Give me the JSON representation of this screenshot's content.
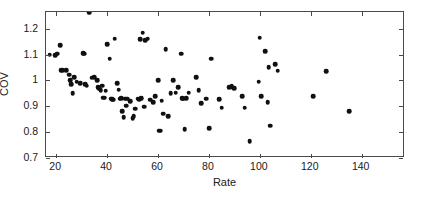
{
  "chart_data": {
    "type": "scatter",
    "title": "",
    "xlabel": "Rate",
    "ylabel": "COV",
    "xlim": [
      16,
      157
    ],
    "ylim": [
      0.7,
      1.265
    ],
    "xticks": [
      20,
      40,
      60,
      80,
      100,
      120,
      140
    ],
    "yticks": [
      0.7,
      0.8,
      0.9,
      1,
      1.1,
      1.2
    ],
    "xticklabels": [
      "20",
      "40",
      "60",
      "80",
      "100",
      "120",
      "140"
    ],
    "yticklabels": [
      "0.7",
      "0.8",
      "0.9",
      "1",
      "1.1",
      "1.2"
    ],
    "grid": false,
    "legend": null,
    "marker": "filled-circle",
    "marker_color": "#101010",
    "series": [
      {
        "name": "observations",
        "x": [
          17.5,
          19.5,
          20.5,
          21.5,
          22.0,
          22.5,
          24.0,
          25.0,
          25.5,
          26.0,
          26.5,
          27.0,
          28.0,
          29.5,
          30.5,
          31.0,
          31.5,
          32.0,
          33.0,
          34.0,
          35.0,
          36.0,
          36.5,
          37.0,
          37.5,
          38.0,
          38.5,
          39.0,
          39.5,
          40.0,
          41.0,
          41.5,
          42.0,
          42.5,
          43.0,
          44.0,
          44.5,
          45.0,
          45.5,
          46.0,
          46.5,
          47.0,
          47.5,
          48.0,
          49.0,
          50.0,
          50.5,
          51.0,
          52.0,
          52.5,
          53.0,
          53.5,
          54.0,
          54.5,
          55.0,
          56.0,
          57.0,
          58.0,
          59.0,
          60.0,
          60.5,
          61.0,
          61.5,
          62.0,
          63.0,
          64.0,
          65.0,
          66.0,
          67.0,
          68.0,
          69.0,
          69.5,
          70.0,
          70.5,
          71.0,
          72.0,
          75.0,
          76.0,
          77.0,
          79.0,
          80.0,
          81.0,
          84.0,
          85.0,
          88.0,
          89.0,
          89.5,
          90.0,
          93.0,
          94.0,
          96.0,
          99.5,
          100.0,
          100.5,
          102.0,
          103.0,
          103.5,
          104.0,
          106.0,
          107.0,
          121.0,
          126.0,
          135.0
        ],
        "y": [
          1.1,
          1.098,
          1.104,
          1.137,
          1.04,
          1.04,
          1.04,
          1.022,
          1.0,
          0.985,
          0.95,
          1.012,
          0.995,
          0.99,
          1.105,
          1.104,
          0.985,
          0.98,
          1.262,
          1.01,
          1.012,
          1.0,
          0.975,
          0.968,
          0.962,
          0.98,
          0.933,
          0.933,
          0.96,
          1.14,
          1.085,
          0.93,
          0.928,
          0.925,
          1.162,
          0.99,
          0.965,
          0.93,
          0.932,
          0.88,
          0.858,
          0.93,
          0.902,
          0.93,
          0.92,
          0.855,
          0.862,
          0.89,
          0.93,
          0.928,
          1.16,
          0.932,
          1.185,
          0.898,
          1.155,
          1.162,
          0.925,
          0.915,
          0.94,
          1.0,
          0.805,
          0.805,
          0.922,
          0.872,
          1.122,
          0.862,
          0.95,
          1.0,
          0.953,
          0.975,
          1.103,
          0.932,
          0.93,
          0.812,
          0.932,
          0.952,
          1.012,
          0.962,
          0.912,
          0.93,
          0.815,
          1.085,
          0.928,
          0.895,
          0.975,
          0.978,
          0.972,
          0.97,
          0.938,
          0.895,
          0.765,
          0.995,
          1.165,
          0.938,
          1.113,
          0.915,
          1.052,
          0.825,
          1.062,
          1.038,
          0.938,
          1.035,
          0.88
        ]
      }
    ]
  }
}
